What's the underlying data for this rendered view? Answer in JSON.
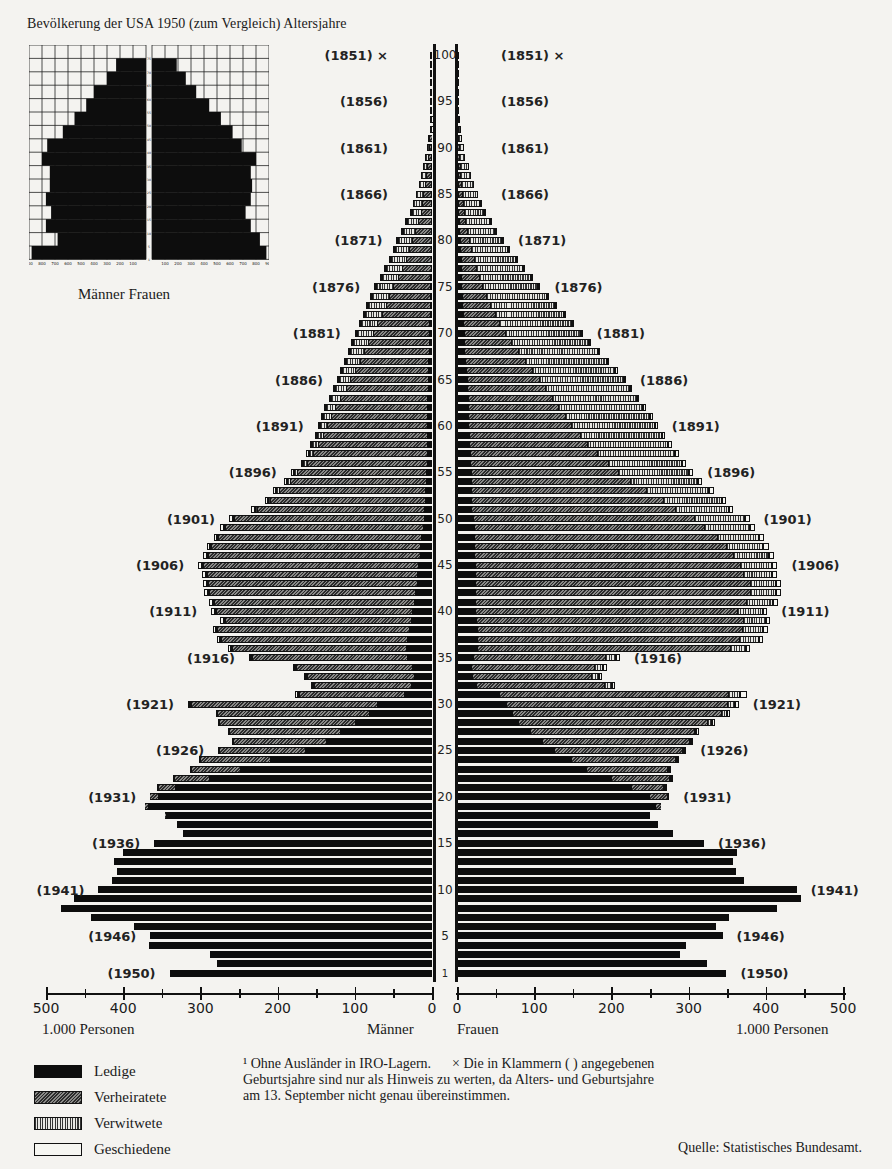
{
  "title": "Bevölkerung der USA 1950 (zum Vergleich) Altersjahre",
  "inset": {
    "caption": "Männer Frauen",
    "left_ticks": [
      "900",
      "800",
      "700",
      "600",
      "500",
      "400",
      "300",
      "200",
      "100"
    ],
    "right_ticks": [
      "100",
      "200",
      "300",
      "400",
      "500",
      "600",
      "700",
      "800",
      "900"
    ],
    "age_marks": [
      "1",
      "5",
      "10",
      "15",
      "20",
      "25",
      "30",
      "35",
      "40",
      "45",
      "50",
      "55",
      "60",
      "65",
      "70",
      "75"
    ]
  },
  "axis": {
    "left_ticks": [
      "500",
      "400",
      "300",
      "200",
      "100",
      "0"
    ],
    "right_ticks": [
      "0",
      "100",
      "200",
      "300",
      "400",
      "500"
    ],
    "left_unit": "1.000 Personen",
    "right_unit": "1.000 Personen",
    "left_side": "Männer",
    "right_side": "Frauen"
  },
  "legend": [
    {
      "key": "ledige",
      "label": "Ledige"
    },
    {
      "key": "verheiratete",
      "label": "Verheiratete"
    },
    {
      "key": "verwitwete",
      "label": "Verwitwete"
    },
    {
      "key": "geschiedene",
      "label": "Geschiedene"
    }
  ],
  "footnote": {
    "line1": "¹ Ohne Ausländer in IRO-Lagern.      × Die in Klammern ( ) angegebenen",
    "line2": "Geburtsjahre sind nur als Hinweis zu werten, da Alters- und Geburtsjahre",
    "line3": "am 13. September nicht genau übereinstimmen."
  },
  "source": "Quelle: Statistisches Bundesamt.",
  "chart_data": {
    "type": "bar",
    "subtype": "population-pyramid-stacked",
    "xlabel": "1.000 Personen",
    "ylabel": "Altersjahre",
    "xlim": [
      0,
      500
    ],
    "x_ticks": [
      0,
      100,
      200,
      300,
      400,
      500
    ],
    "y_ticks": [
      1,
      5,
      10,
      15,
      20,
      25,
      30,
      35,
      40,
      45,
      50,
      55,
      60,
      65,
      70,
      75,
      80,
      85,
      90,
      95,
      100
    ],
    "legend_position": "bottom-left",
    "grid": false,
    "stack_order": [
      "Ledige",
      "Verheiratete",
      "Verwitwete",
      "Geschiedene"
    ],
    "birth_year_labels": [
      {
        "age": 100,
        "year": "(1851)",
        "note": "×"
      },
      {
        "age": 95,
        "year": "(1856)"
      },
      {
        "age": 90,
        "year": "(1861)"
      },
      {
        "age": 85,
        "year": "(1866)"
      },
      {
        "age": 80,
        "year": "(1871)"
      },
      {
        "age": 75,
        "year": "(1876)"
      },
      {
        "age": 70,
        "year": "(1881)"
      },
      {
        "age": 65,
        "year": "(1886)"
      },
      {
        "age": 60,
        "year": "(1891)"
      },
      {
        "age": 55,
        "year": "(1896)"
      },
      {
        "age": 50,
        "year": "(1901)"
      },
      {
        "age": 45,
        "year": "(1906)"
      },
      {
        "age": 40,
        "year": "(1911)"
      },
      {
        "age": 35,
        "year": "(1916)"
      },
      {
        "age": 30,
        "year": "(1921)"
      },
      {
        "age": 25,
        "year": "(1926)"
      },
      {
        "age": 20,
        "year": "(1931)"
      },
      {
        "age": 15,
        "year": "(1936)"
      },
      {
        "age": 10,
        "year": "(1941)"
      },
      {
        "age": 5,
        "year": "(1946)"
      },
      {
        "age": 1,
        "year": "(1950)"
      }
    ],
    "series_note": "Each entry: [age, Ledige, Verheiratete, Verwitwete, Geschiedene] in thousands (estimated from pixels)",
    "maenner": [
      [
        100,
        0,
        0,
        1,
        0
      ],
      [
        99,
        0,
        0,
        1,
        0
      ],
      [
        98,
        0,
        0,
        1,
        0
      ],
      [
        97,
        0,
        0,
        1,
        0
      ],
      [
        96,
        0,
        0,
        1,
        0
      ],
      [
        95,
        0,
        1,
        1,
        0
      ],
      [
        94,
        0,
        1,
        1,
        0
      ],
      [
        93,
        0,
        1,
        2,
        0
      ],
      [
        92,
        0,
        1,
        2,
        0
      ],
      [
        91,
        0,
        2,
        3,
        0
      ],
      [
        90,
        1,
        2,
        4,
        0
      ],
      [
        89,
        1,
        3,
        5,
        0
      ],
      [
        88,
        1,
        4,
        6,
        0
      ],
      [
        87,
        1,
        5,
        8,
        0
      ],
      [
        86,
        1,
        7,
        9,
        0
      ],
      [
        85,
        1,
        9,
        11,
        0
      ],
      [
        84,
        1,
        11,
        13,
        0
      ],
      [
        83,
        1,
        13,
        14,
        1
      ],
      [
        82,
        2,
        16,
        16,
        1
      ],
      [
        81,
        2,
        19,
        18,
        1
      ],
      [
        80,
        2,
        23,
        20,
        1
      ],
      [
        79,
        2,
        27,
        21,
        1
      ],
      [
        78,
        2,
        31,
        22,
        1
      ],
      [
        77,
        2,
        36,
        23,
        1
      ],
      [
        76,
        3,
        41,
        23,
        1
      ],
      [
        75,
        3,
        47,
        24,
        1
      ],
      [
        74,
        3,
        52,
        24,
        1
      ],
      [
        73,
        3,
        57,
        24,
        1
      ],
      [
        72,
        3,
        62,
        23,
        1
      ],
      [
        71,
        4,
        67,
        22,
        1
      ],
      [
        70,
        4,
        72,
        22,
        2
      ],
      [
        69,
        4,
        78,
        21,
        2
      ],
      [
        68,
        4,
        83,
        20,
        2
      ],
      [
        67,
        5,
        88,
        19,
        2
      ],
      [
        66,
        5,
        94,
        18,
        2
      ],
      [
        65,
        5,
        100,
        16,
        2
      ],
      [
        64,
        5,
        106,
        15,
        2
      ],
      [
        63,
        6,
        113,
        13,
        2
      ],
      [
        62,
        6,
        119,
        12,
        3
      ],
      [
        61,
        6,
        124,
        11,
        3
      ],
      [
        60,
        6,
        129,
        10,
        3
      ],
      [
        59,
        6,
        134,
        9,
        3
      ],
      [
        58,
        7,
        140,
        8,
        3
      ],
      [
        57,
        7,
        146,
        7,
        3
      ],
      [
        56,
        7,
        154,
        6,
        3
      ],
      [
        55,
        8,
        165,
        6,
        4
      ],
      [
        54,
        8,
        175,
        5,
        4
      ],
      [
        53,
        9,
        188,
        5,
        4
      ],
      [
        52,
        9,
        200,
        4,
        4
      ],
      [
        51,
        10,
        215,
        4,
        5
      ],
      [
        50,
        11,
        244,
        3,
        5
      ],
      [
        49,
        12,
        255,
        3,
        5
      ],
      [
        48,
        14,
        262,
        2,
        5
      ],
      [
        47,
        15,
        270,
        2,
        5
      ],
      [
        46,
        16,
        274,
        2,
        5
      ],
      [
        45,
        18,
        278,
        2,
        5
      ],
      [
        44,
        19,
        272,
        2,
        5
      ],
      [
        43,
        20,
        270,
        2,
        5
      ],
      [
        42,
        22,
        266,
        2,
        5
      ],
      [
        41,
        24,
        259,
        1,
        5
      ],
      [
        40,
        26,
        254,
        1,
        5
      ],
      [
        39,
        27,
        242,
        1,
        4
      ],
      [
        38,
        30,
        249,
        1,
        4
      ],
      [
        37,
        32,
        242,
        1,
        4
      ],
      [
        36,
        34,
        225,
        1,
        4
      ],
      [
        35,
        33,
        200,
        1,
        3
      ],
      [
        34,
        26,
        150,
        1,
        3
      ],
      [
        33,
        24,
        138,
        1,
        3
      ],
      [
        32,
        27,
        126,
        1,
        3
      ],
      [
        31,
        36,
        137,
        1,
        3
      ],
      [
        30,
        72,
        240,
        1,
        3
      ],
      [
        29,
        82,
        196,
        0,
        2
      ],
      [
        28,
        100,
        175,
        0,
        2
      ],
      [
        27,
        120,
        142,
        0,
        2
      ],
      [
        26,
        138,
        119,
        0,
        2
      ],
      [
        25,
        165,
        110,
        0,
        2
      ],
      [
        24,
        210,
        90,
        0,
        2
      ],
      [
        23,
        250,
        62,
        0,
        1
      ],
      [
        22,
        290,
        45,
        0,
        1
      ],
      [
        21,
        335,
        20,
        0,
        1
      ],
      [
        20,
        355,
        10,
        0,
        0
      ],
      [
        19,
        368,
        4,
        0,
        0
      ],
      [
        18,
        345,
        1,
        0,
        0
      ],
      [
        17,
        330,
        0,
        0,
        0
      ],
      [
        16,
        322,
        0,
        0,
        0
      ],
      [
        15,
        360,
        0,
        0,
        0
      ],
      [
        14,
        400,
        0,
        0,
        0
      ],
      [
        13,
        412,
        0,
        0,
        0
      ],
      [
        12,
        408,
        0,
        0,
        0
      ],
      [
        11,
        415,
        0,
        0,
        0
      ],
      [
        10,
        432,
        0,
        0,
        0
      ],
      [
        9,
        464,
        0,
        0,
        0
      ],
      [
        8,
        481,
        0,
        0,
        0
      ],
      [
        7,
        442,
        0,
        0,
        0
      ],
      [
        6,
        386,
        0,
        0,
        0
      ],
      [
        5,
        365,
        0,
        0,
        0
      ],
      [
        4,
        367,
        0,
        0,
        0
      ],
      [
        3,
        288,
        0,
        0,
        0
      ],
      [
        2,
        278,
        0,
        0,
        0
      ],
      [
        1,
        340,
        0,
        0,
        0
      ]
    ],
    "frauen": [
      [
        100,
        0,
        0,
        1,
        0
      ],
      [
        99,
        0,
        0,
        1,
        0
      ],
      [
        98,
        0,
        0,
        1,
        0
      ],
      [
        97,
        0,
        0,
        1,
        0
      ],
      [
        96,
        0,
        0,
        1,
        0
      ],
      [
        95,
        0,
        0,
        2,
        0
      ],
      [
        94,
        0,
        0,
        2,
        0
      ],
      [
        93,
        0,
        1,
        3,
        0
      ],
      [
        92,
        0,
        1,
        4,
        0
      ],
      [
        91,
        0,
        1,
        5,
        0
      ],
      [
        90,
        1,
        1,
        7,
        0
      ],
      [
        89,
        1,
        1,
        9,
        0
      ],
      [
        88,
        2,
        2,
        11,
        0
      ],
      [
        87,
        2,
        2,
        14,
        0
      ],
      [
        86,
        2,
        3,
        17,
        0
      ],
      [
        85,
        3,
        4,
        20,
        0
      ],
      [
        84,
        3,
        5,
        24,
        1
      ],
      [
        83,
        3,
        6,
        28,
        1
      ],
      [
        82,
        4,
        7,
        33,
        1
      ],
      [
        81,
        4,
        9,
        38,
        1
      ],
      [
        80,
        5,
        11,
        44,
        1
      ],
      [
        79,
        5,
        13,
        50,
        1
      ],
      [
        78,
        6,
        16,
        56,
        1
      ],
      [
        77,
        6,
        19,
        62,
        1
      ],
      [
        76,
        7,
        22,
        68,
        1
      ],
      [
        75,
        7,
        26,
        74,
        1
      ],
      [
        74,
        8,
        30,
        80,
        1
      ],
      [
        73,
        8,
        35,
        85,
        1
      ],
      [
        72,
        9,
        40,
        90,
        2
      ],
      [
        71,
        9,
        46,
        94,
        2
      ],
      [
        70,
        10,
        53,
        98,
        2
      ],
      [
        69,
        10,
        60,
        101,
        2
      ],
      [
        68,
        11,
        68,
        104,
        2
      ],
      [
        67,
        12,
        76,
        106,
        3
      ],
      [
        66,
        13,
        84,
        108,
        3
      ],
      [
        65,
        14,
        92,
        110,
        3
      ],
      [
        64,
        14,
        100,
        110,
        3
      ],
      [
        63,
        15,
        108,
        110,
        3
      ],
      [
        62,
        15,
        116,
        110,
        4
      ],
      [
        61,
        16,
        124,
        110,
        4
      ],
      [
        60,
        16,
        132,
        108,
        4
      ],
      [
        59,
        17,
        142,
        106,
        4
      ],
      [
        58,
        17,
        152,
        104,
        5
      ],
      [
        57,
        18,
        164,
        100,
        5
      ],
      [
        56,
        18,
        178,
        96,
        5
      ],
      [
        55,
        19,
        190,
        92,
        5
      ],
      [
        54,
        19,
        205,
        88,
        6
      ],
      [
        53,
        20,
        225,
        82,
        6
      ],
      [
        52,
        20,
        247,
        76,
        6
      ],
      [
        51,
        20,
        262,
        70,
        6
      ],
      [
        50,
        22,
        285,
        66,
        6
      ],
      [
        49,
        23,
        297,
        60,
        6
      ],
      [
        48,
        23,
        314,
        54,
        7
      ],
      [
        47,
        23,
        326,
        48,
        7
      ],
      [
        46,
        23,
        335,
        46,
        7
      ],
      [
        45,
        24,
        342,
        42,
        7
      ],
      [
        44,
        25,
        345,
        38,
        7
      ],
      [
        43,
        25,
        354,
        34,
        7
      ],
      [
        42,
        25,
        354,
        34,
        7
      ],
      [
        41,
        25,
        350,
        34,
        7
      ],
      [
        40,
        25,
        338,
        33,
        6
      ],
      [
        39,
        26,
        344,
        30,
        6
      ],
      [
        38,
        27,
        342,
        28,
        6
      ],
      [
        37,
        27,
        338,
        26,
        6
      ],
      [
        36,
        27,
        327,
        21,
        5
      ],
      [
        35,
        22,
        170,
        14,
        5
      ],
      [
        34,
        20,
        158,
        11,
        5
      ],
      [
        33,
        21,
        153,
        10,
        4
      ],
      [
        32,
        26,
        164,
        11,
        4
      ],
      [
        31,
        56,
        295,
        16,
        9
      ],
      [
        30,
        65,
        285,
        10,
        5
      ],
      [
        29,
        72,
        270,
        8,
        4
      ],
      [
        28,
        80,
        244,
        6,
        4
      ],
      [
        27,
        96,
        211,
        3,
        3
      ],
      [
        26,
        112,
        188,
        3,
        3
      ],
      [
        25,
        128,
        165,
        2,
        2
      ],
      [
        24,
        150,
        135,
        1,
        2
      ],
      [
        23,
        170,
        104,
        1,
        2
      ],
      [
        22,
        202,
        75,
        1,
        2
      ],
      [
        21,
        230,
        40,
        1,
        1
      ],
      [
        20,
        252,
        22,
        0,
        1
      ],
      [
        19,
        258,
        6,
        0,
        0
      ],
      [
        18,
        250,
        0,
        0,
        0
      ],
      [
        17,
        260,
        0,
        0,
        0
      ],
      [
        16,
        280,
        0,
        0,
        0
      ],
      [
        15,
        320,
        0,
        0,
        0
      ],
      [
        14,
        363,
        0,
        0,
        0
      ],
      [
        13,
        358,
        0,
        0,
        0
      ],
      [
        12,
        362,
        0,
        0,
        0
      ],
      [
        11,
        372,
        0,
        0,
        0
      ],
      [
        10,
        440,
        0,
        0,
        0
      ],
      [
        9,
        446,
        0,
        0,
        0
      ],
      [
        8,
        415,
        0,
        0,
        0
      ],
      [
        7,
        352,
        0,
        0,
        0
      ],
      [
        6,
        336,
        0,
        0,
        0
      ],
      [
        5,
        344,
        0,
        0,
        0
      ],
      [
        4,
        296,
        0,
        0,
        0
      ],
      [
        3,
        289,
        0,
        0,
        0
      ],
      [
        2,
        324,
        0,
        0,
        0
      ],
      [
        1,
        349,
        0,
        0,
        0
      ]
    ]
  }
}
